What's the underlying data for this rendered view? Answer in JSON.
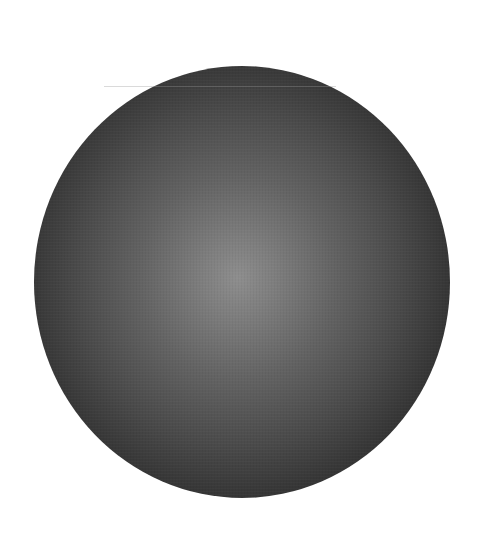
{
  "scene": {
    "background_color": "#ffffff",
    "subject": "shaded-sphere",
    "sphere": {
      "highlight_color": "#8e8e8e",
      "mid_color": "#626262",
      "edge_color": "#242424"
    }
  }
}
